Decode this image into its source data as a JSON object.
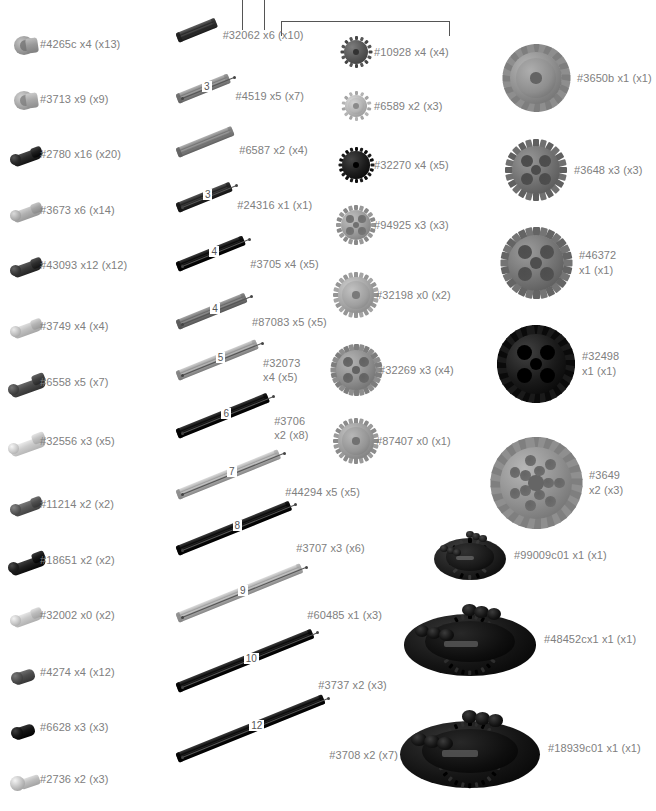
{
  "document": {
    "title": "LEGO Technic Parts Inventory",
    "label_color": "#808080",
    "line_color": "#555555",
    "background": "#ffffff"
  },
  "leader_lines": {
    "description": "callout leader lines entering from the top edge",
    "verticals": [
      {
        "name": "leader-line-1",
        "x": 242,
        "top": 0,
        "height": 30
      },
      {
        "name": "leader-line-2",
        "x": 264,
        "top": 0,
        "height": 30
      }
    ],
    "bracket": {
      "name": "callout-bracket",
      "left": 281,
      "top": 21,
      "width": 167,
      "height": 14
    }
  },
  "columns": [
    {
      "id": "column-connectors",
      "name": "connector-pins-column",
      "items": [
        {
          "part": "#4265c",
          "qty": "x4",
          "total": "(x13)",
          "label": "#4265c x4 (x13)",
          "y": 30,
          "art": "bush",
          "color": "#9a9a9a",
          "dark": "#6e6e6e"
        },
        {
          "part": "#3713",
          "qty": "x9",
          "total": "(x9)",
          "label": "#3713 x9 (x9)",
          "y": 85,
          "art": "bush",
          "color": "#a8a8a8",
          "dark": "#7a7a7a"
        },
        {
          "part": "#2780",
          "qty": "x16",
          "total": "(x20)",
          "label": "#2780 x16 (x20)",
          "y": 140,
          "art": "pin",
          "color": "#2a2a2a",
          "dark": "#141414"
        },
        {
          "part": "#3673",
          "qty": "x6",
          "total": "(x14)",
          "label": "#3673 x6 (x14)",
          "y": 196,
          "art": "pin",
          "color": "#b0b0b0",
          "dark": "#8a8a8a"
        },
        {
          "part": "#43093",
          "qty": "x12",
          "total": "(x12)",
          "label": "#43093 x12 (x12)",
          "y": 251,
          "art": "pin",
          "color": "#3a3a3a",
          "dark": "#1e1e1e"
        },
        {
          "part": "#3749",
          "qty": "x4",
          "total": "(x4)",
          "label": "#3749 x4 (x4)",
          "y": 312,
          "art": "pin",
          "color": "#c0c0c0",
          "dark": "#949494"
        },
        {
          "part": "#6558",
          "qty": "x5",
          "total": "(x7)",
          "label": "#6558 x5 (x7)",
          "y": 368,
          "art": "longpin",
          "color": "#4a4a4a",
          "dark": "#262626"
        },
        {
          "part": "#32556",
          "qty": "x3",
          "total": "(x5)",
          "label": "#32556 x3 (x5)",
          "y": 427,
          "art": "longpin",
          "color": "#cccccc",
          "dark": "#9e9e9e"
        },
        {
          "part": "#11214",
          "qty": "x2",
          "total": "(x2)",
          "label": "#11214 x2 (x2)",
          "y": 490,
          "art": "pin",
          "color": "#5a5a5a",
          "dark": "#333333"
        },
        {
          "part": "#18651",
          "qty": "x2",
          "total": "(x2)",
          "label": "#18651 x2 (x2)",
          "y": 546,
          "art": "longpin",
          "color": "#202020",
          "dark": "#0d0d0d"
        },
        {
          "part": "#32002",
          "qty": "x0",
          "total": "(x2)",
          "label": "#32002 x0 (x2)",
          "y": 601,
          "art": "pin",
          "color": "#c8c8c8",
          "dark": "#9a9a9a"
        },
        {
          "part": "#4274",
          "qty": "x4",
          "total": "(x12)",
          "label": "#4274 x4 (x12)",
          "y": 658,
          "art": "shortpin",
          "color": "#4e4e4e",
          "dark": "#2a2a2a"
        },
        {
          "part": "#6628",
          "qty": "x3",
          "total": "(x3)",
          "label": "#6628 x3 (x3)",
          "y": 713,
          "art": "shortpin",
          "color": "#141414",
          "dark": "#000000"
        },
        {
          "part": "#2736",
          "qty": "x2",
          "total": "(x3)",
          "label": "#2736 x2 (x3)",
          "y": 765,
          "art": "ballpin",
          "color": "#bdbdbd",
          "dark": "#8e8e8e"
        }
      ]
    },
    {
      "id": "column-axles",
      "name": "axles-column",
      "items": [
        {
          "part": "#32062",
          "qty": "x6",
          "total": "(x10)",
          "label": "#32062 x6 (x10)",
          "label2": "",
          "y": 33,
          "len": 0,
          "px": 42,
          "color": "#3a3a3a",
          "dark": "#1a1a1a",
          "two_line": false
        },
        {
          "part": "#4519",
          "qty": "x5",
          "total": "(x7)",
          "label": "#4519 x5 (x7)",
          "label2": "",
          "y": 94,
          "len": 3,
          "px": 56,
          "color": "#8f8f8f",
          "dark": "#646464",
          "two_line": false
        },
        {
          "part": "#6587",
          "qty": "x2",
          "total": "(x4)",
          "label": "#6587 x2 (x4)",
          "label2": "",
          "y": 148,
          "len": 0,
          "px": 60,
          "color": "#8a8a8a",
          "dark": "#5e5e5e",
          "two_line": false
        },
        {
          "part": "#24316",
          "qty": "x1",
          "total": "(x1)",
          "label": "#24316 x1 (x1)",
          "label2": "",
          "y": 203,
          "len": 3,
          "px": 58,
          "color": "#2e2e2e",
          "dark": "#141414",
          "two_line": false
        },
        {
          "part": "#3705",
          "qty": "x4",
          "total": "(x5)",
          "label": "#3705 x4 (x5)",
          "label2": "",
          "y": 262,
          "len": 4,
          "px": 72,
          "color": "#141414",
          "dark": "#000000",
          "two_line": false
        },
        {
          "part": "#87083",
          "qty": "x5",
          "total": "(x5)",
          "label": "#87083 x5 (x5)",
          "label2": "",
          "y": 320,
          "len": 4,
          "px": 74,
          "color": "#7d7d7d",
          "dark": "#545454",
          "two_line": false
        },
        {
          "part": "#32073",
          "qty": "x4",
          "total": "(x5)",
          "label": "#32073",
          "label2": "x4 (x5)",
          "y": 371,
          "len": 5,
          "px": 86,
          "color": "#a8a8a8",
          "dark": "#7a7a7a",
          "two_line": true
        },
        {
          "part": "#3706",
          "qty": "x2",
          "total": "(x8)",
          "label": "#3706",
          "label2": "x2 (x8)",
          "y": 429,
          "len": 6,
          "px": 98,
          "color": "#141414",
          "dark": "#000000",
          "two_line": true
        },
        {
          "part": "#44294",
          "qty": "x5",
          "total": "(x5)",
          "label": "#44294 x5 (x5)",
          "label2": "",
          "y": 490,
          "len": 7,
          "px": 110,
          "color": "#b4b4b4",
          "dark": "#868686",
          "two_line": false
        },
        {
          "part": "#3707",
          "qty": "x3",
          "total": "(x6)",
          "label": "#3707 x3 (x6)",
          "label2": "",
          "y": 546,
          "len": 8,
          "px": 122,
          "color": "#141414",
          "dark": "#000000",
          "two_line": false
        },
        {
          "part": "#60485",
          "qty": "x1",
          "total": "(x3)",
          "label": "#60485 x1 (x3)",
          "label2": "",
          "y": 613,
          "len": 9,
          "px": 134,
          "color": "#b4b4b4",
          "dark": "#868686",
          "two_line": false
        },
        {
          "part": "#3737",
          "qty": "x2",
          "total": "(x3)",
          "label": "#3737 x2 (x3)",
          "label2": "",
          "y": 683,
          "len": 10,
          "px": 146,
          "color": "#141414",
          "dark": "#000000",
          "two_line": false
        },
        {
          "part": "#3708",
          "qty": "x2",
          "total": "(x7)",
          "label": "#3708 x2 (x7)",
          "label2": "",
          "y": 753,
          "len": 12,
          "px": 158,
          "color": "#141414",
          "dark": "#000000",
          "two_line": false
        }
      ]
    },
    {
      "id": "column-gears-small",
      "name": "small-gears-column",
      "items": [
        {
          "part": "#10928",
          "qty": "x4",
          "total": "(x4)",
          "label": "#10928 x4 (x4)",
          "y": 37,
          "r": 15,
          "teeth": 16,
          "color": "#555555",
          "dark": "#333333",
          "style": "solid"
        },
        {
          "part": "#6589",
          "qty": "x2",
          "total": "(x3)",
          "label": "#6589 x2 (x3)",
          "y": 92,
          "r": 14,
          "teeth": 14,
          "color": "#b4b4b4",
          "dark": "#8a8a8a",
          "style": "clutch"
        },
        {
          "part": "#32270",
          "qty": "x4",
          "total": "(x5)",
          "label": "#32270 x4 (x5)",
          "y": 148,
          "r": 17,
          "teeth": 20,
          "color": "#1c1c1c",
          "dark": "#000000",
          "style": "solid"
        },
        {
          "part": "#94925",
          "qty": "x3",
          "total": "(x3)",
          "label": "#94925 x3 (x3)",
          "y": 206,
          "r": 19,
          "teeth": 20,
          "color": "#999999",
          "dark": "#707070",
          "style": "spoked"
        },
        {
          "part": "#32198",
          "qty": "x0",
          "total": "(x2)",
          "label": "#32198 x0 (x2)",
          "y": 273,
          "r": 22,
          "teeth": 24,
          "color": "#a5a5a5",
          "dark": "#7a7a7a",
          "style": "bevel"
        },
        {
          "part": "#32269",
          "qty": "x3",
          "total": "(x4)",
          "label": "#32269 x3 (x4)",
          "y": 345,
          "r": 25,
          "teeth": 28,
          "color": "#8d8d8d",
          "dark": "#626262",
          "style": "spoked"
        },
        {
          "part": "#87407",
          "qty": "x0",
          "total": "(x1)",
          "label": "#87407 x0 (x1)",
          "y": 419,
          "r": 22,
          "teeth": 24,
          "color": "#9b9b9b",
          "dark": "#717171",
          "style": "bevel"
        }
      ]
    },
    {
      "id": "column-gears-large",
      "name": "large-gears-column",
      "items": [
        {
          "part": "#3650b",
          "qty": "x1",
          "total": "(x1)",
          "label": "#3650b",
          "label2": "x1 (x1)",
          "one_line": "#3650b x1 (x1)",
          "two_line": false,
          "y": 45,
          "r": 33,
          "teeth": 32,
          "color": "#8e8e8e",
          "dark": "#646464",
          "style": "clutch"
        },
        {
          "part": "#3648",
          "qty": "x3",
          "total": "(x3)",
          "label": "#3648",
          "label2": "x3 (x3)",
          "one_line": "#3648 x3 (x3)",
          "two_line": false,
          "y": 140,
          "r": 30,
          "teeth": 24,
          "color": "#707070",
          "dark": "#4c4c4c",
          "style": "holed"
        },
        {
          "part": "#46372",
          "qty": "x1",
          "total": "(x1)",
          "label": "#46372",
          "label2": "x1 (x1)",
          "one_line": "",
          "two_line": true,
          "y": 228,
          "r": 35,
          "teeth": 28,
          "color": "#747474",
          "dark": "#4e4e4e",
          "style": "holed"
        },
        {
          "part": "#32498",
          "qty": "x1",
          "total": "(x1)",
          "label": "#32498",
          "label2": "x1 (x1)",
          "one_line": "",
          "two_line": true,
          "y": 326,
          "r": 38,
          "teeth": 40,
          "color": "#1a1a1a",
          "dark": "#000000",
          "style": "holed"
        },
        {
          "part": "#3649",
          "qty": "x2",
          "total": "(x3)",
          "label": "#3649",
          "label2": "x2 (x3)",
          "one_line": "",
          "two_line": true,
          "y": 438,
          "r": 45,
          "teeth": 40,
          "color": "#8f8f8f",
          "dark": "#656565",
          "style": "manyholes"
        }
      ]
    },
    {
      "id": "column-differentials",
      "name": "differentials-column",
      "items": [
        {
          "part": "#99009c01",
          "qty": "x1",
          "total": "(x1)",
          "label": "#99009c01 x1 (x1)",
          "y": 525,
          "w": 72,
          "h": 60,
          "color": "#1e1e1e",
          "dark": "#000000"
        },
        {
          "part": "#48452cx1",
          "qty": "x1",
          "total": "(x1)",
          "label": "#48452cx1 x1 (x1)",
          "y": 595,
          "w": 132,
          "h": 88,
          "color": "#141414",
          "dark": "#000000"
        },
        {
          "part": "#18939c01",
          "qty": "x1",
          "total": "(x1)",
          "label": "#18939c01 x1 (x1)",
          "y": 700,
          "w": 140,
          "h": 96,
          "color": "#141414",
          "dark": "#000000"
        }
      ]
    }
  ]
}
